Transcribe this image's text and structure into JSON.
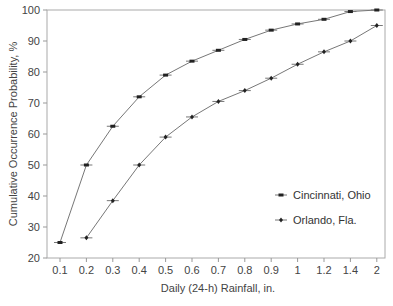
{
  "chart_data": {
    "type": "line",
    "title": "",
    "xlabel": "Daily (24-h) Rainfall, in.",
    "ylabel": "Cumulative Occurrence Probability, %",
    "categories": [
      "0.1",
      "0.2",
      "0.3",
      "0.4",
      "0.5",
      "0.6",
      "0.7",
      "0.8",
      "0.9",
      "1",
      "1.2",
      "1.4",
      "2"
    ],
    "y_ticks": [
      20,
      30,
      40,
      50,
      60,
      70,
      80,
      90,
      100
    ],
    "ylim": [
      20,
      100
    ],
    "grid": false,
    "legend_position": "right-middle",
    "series": [
      {
        "name": "Cincinnati, Ohio",
        "marker": "square-bar",
        "values": [
          25,
          50,
          62.5,
          72,
          79,
          83.5,
          87,
          90.5,
          93.5,
          95.5,
          97,
          99.5,
          100
        ]
      },
      {
        "name": "Orlando, Fla.",
        "marker": "diamond-bar",
        "values": [
          null,
          26.5,
          38.5,
          50,
          59,
          65.5,
          70.5,
          74,
          78,
          82.5,
          86.5,
          90,
          95
        ]
      }
    ]
  },
  "colors": {
    "line": "#777777",
    "marker": "#222222",
    "axis": "#999999"
  }
}
